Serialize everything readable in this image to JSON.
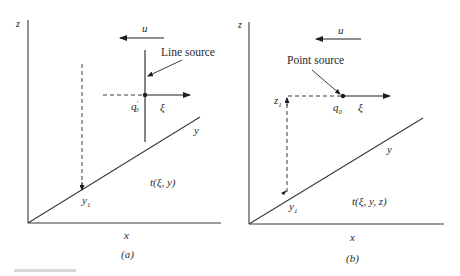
{
  "panels": {
    "a": {
      "axes": {
        "z": "z",
        "x": "x",
        "y": "y"
      },
      "wind_label": "u",
      "source_label": "Line source",
      "source_symbol": "q",
      "source_prime": "′",
      "source_sub": "0",
      "downwind_label": "ξ",
      "receptor_label": "y",
      "receptor_sub": "1",
      "field_label": "t(ξ, y)",
      "caption": "(a)"
    },
    "b": {
      "axes": {
        "z": "z",
        "x": "x",
        "y": "y"
      },
      "wind_label": "u",
      "source_label": "Point source",
      "source_symbol": "q",
      "source_sub": "0",
      "height_label": "z",
      "height_sub": "1",
      "downwind_label": "ξ",
      "receptor_label": "y",
      "receptor_sub": "1",
      "field_label": "t(ξ, y, z)",
      "caption": "(b)"
    }
  },
  "colors": {
    "ink": "#1e1e1e",
    "background": "#ffffff"
  }
}
